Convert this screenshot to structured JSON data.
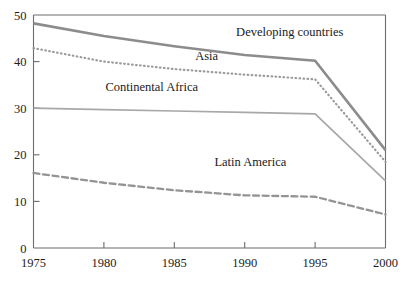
{
  "chart_data": {
    "type": "line",
    "title": "",
    "subtitle": "",
    "xlabel": "",
    "ylabel": "",
    "x": [
      1975,
      1980,
      1985,
      1990,
      1995,
      2000
    ],
    "xlim": [
      1975,
      2000
    ],
    "ylim": [
      0,
      50
    ],
    "x_ticks": [
      "1975",
      "1980",
      "1985",
      "1990",
      "1995",
      "2000"
    ],
    "y_ticks": [
      "0",
      "10",
      "20",
      "30",
      "40",
      "50"
    ],
    "grid": false,
    "legend_position": "inline-annotations",
    "series": [
      {
        "name": "Developing countries",
        "style": "solid-thick",
        "color": "#8c8c8c",
        "values": [
          48.2,
          45.5,
          43.3,
          41.4,
          40.2,
          21.0
        ],
        "label_x": 1993.2,
        "label_y": 45.5
      },
      {
        "name": "Asia",
        "style": "dotted",
        "color": "#9a9a9a",
        "values": [
          42.9,
          40.0,
          38.4,
          37.2,
          36.2,
          18.5
        ],
        "label_x": 1987.3,
        "label_y": 40.4
      },
      {
        "name": "Continental Africa",
        "style": "solid-thin",
        "color": "#a8a8a8",
        "values": [
          30.0,
          29.7,
          29.4,
          29.1,
          28.8,
          14.4
        ],
        "label_x": 1983.4,
        "label_y": 33.6
      },
      {
        "name": "Latin America",
        "style": "dashed",
        "color": "#949494",
        "values": [
          16.1,
          14.0,
          12.4,
          11.3,
          11.0,
          7.2
        ],
        "label_x": 1990.4,
        "label_y": 17.6
      }
    ]
  },
  "axes": {
    "y_tick_values": [
      0,
      10,
      20,
      30,
      40,
      50
    ],
    "x_tick_values": [
      1975,
      1980,
      1985,
      1990,
      1995,
      2000
    ]
  }
}
